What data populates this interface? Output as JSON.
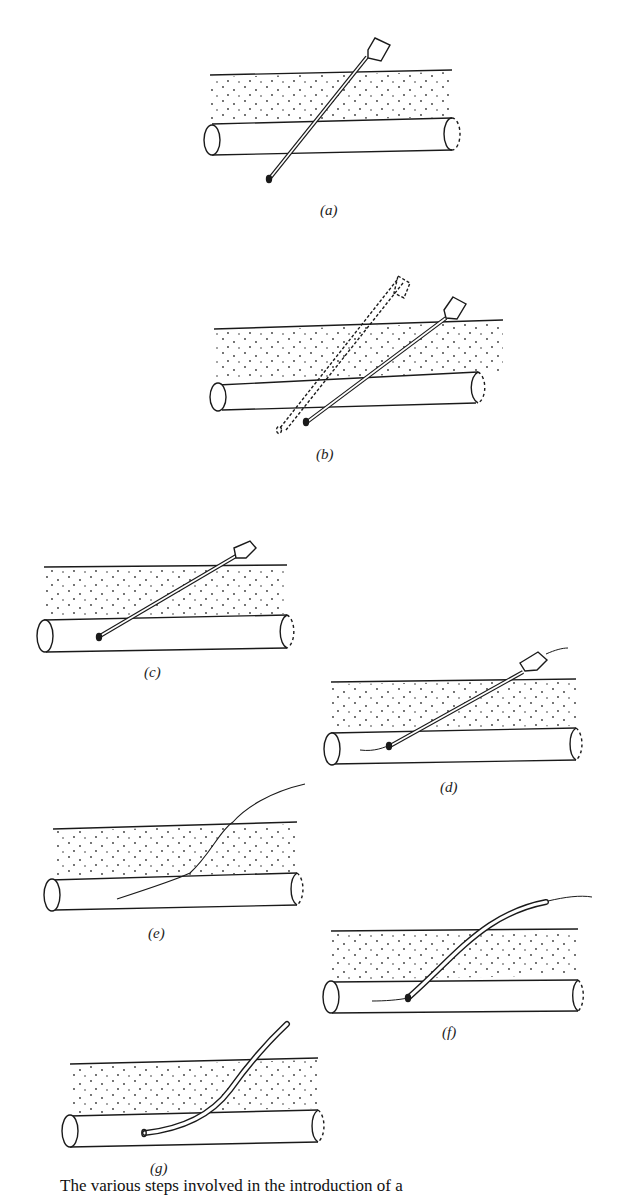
{
  "figure": {
    "panels": [
      {
        "id": "a",
        "label": "(a)",
        "description": "Needle inserted through tissue into vessel"
      },
      {
        "id": "b",
        "label": "(b)",
        "description": "Needle withdrawn slowly until blood flows"
      },
      {
        "id": "c",
        "label": "(c)",
        "description": "Needle tip positioned within vessel lumen"
      },
      {
        "id": "d",
        "label": "(d)",
        "description": "Guidewire passed through needle into vessel"
      },
      {
        "id": "e",
        "label": "(e)",
        "description": "Needle removed, guidewire left in place"
      },
      {
        "id": "f",
        "label": "(f)",
        "description": "Catheter threaded over guidewire into vessel"
      },
      {
        "id": "g",
        "label": "(g)",
        "description": "Guidewire removed, catheter remains in vessel"
      }
    ],
    "caption": "The various steps involved in the introduction of a"
  },
  "colors": {
    "line": "#1a1a1a",
    "background": "#ffffff"
  }
}
